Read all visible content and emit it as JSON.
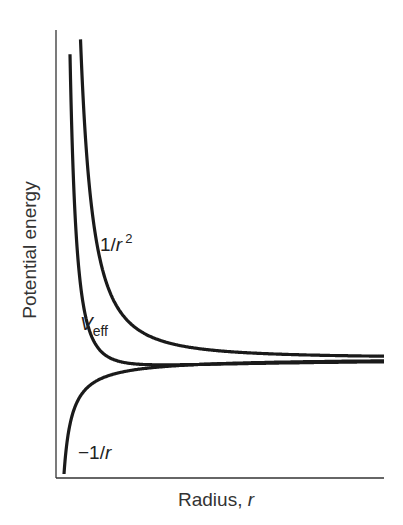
{
  "chart_data": {
    "type": "line",
    "title": "",
    "xlabel": "Radius, r",
    "ylabel": "Potential energy",
    "grid": false,
    "legend": "none (curves labeled inline)",
    "ticks": {
      "x": [],
      "y": []
    },
    "series": [
      {
        "name": "1/r^2",
        "label_text": "1/r",
        "label_sup": "2",
        "description": "repulsive centrifugal term, diverges to +inf as r->0, decays to 0"
      },
      {
        "name": "V_eff",
        "label_main": "V",
        "label_sub": "eff",
        "description": "effective potential = 1/r^2 - 1/r, shallow minimum near small r then approaches 0"
      },
      {
        "name": "-1/r",
        "label_text": "−1/r",
        "description": "attractive Coulomb term, diverges to -inf as r->0, rises to 0"
      }
    ],
    "layout": {
      "axis_origin_px": [
        56,
        478
      ],
      "axis_top_px": 30,
      "axis_right_px": 384,
      "zero_energy_px": 358,
      "k_inv_r2": 191232,
      "c_inv_r": 928
    }
  },
  "labels": {
    "ylabel": "Potential energy",
    "xlabel_main": "Radius, ",
    "xlabel_var": "r",
    "inv_r2_main": "1/",
    "inv_r2_var": "r",
    "inv_r2_sup": "2",
    "veff_main": "V",
    "veff_sub": "eff",
    "neg_inv_r": "−1/",
    "neg_inv_r_var": "r"
  },
  "colors": {
    "curve": "#1a1a1a",
    "axis": "#333333",
    "text": "#222222"
  }
}
